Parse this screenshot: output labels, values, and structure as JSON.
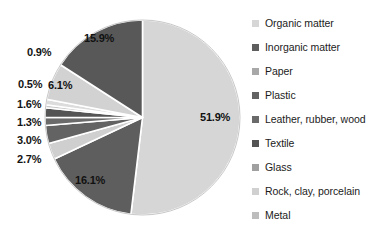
{
  "chart_data": {
    "type": "pie",
    "title": "",
    "subtitle": "",
    "xlabel": "",
    "ylabel": "",
    "legend_position": "right",
    "grid": false,
    "categories": [
      "Organic matter",
      "Inorganic matter",
      "Paper",
      "Plastic",
      "Leather, rubber, wood",
      "Textile",
      "Glass",
      "Rock, clay, porcelain",
      "Metal",
      "Particles < 10 mm"
    ],
    "values": [
      51.9,
      16.1,
      2.7,
      3.0,
      1.3,
      1.6,
      0.5,
      0.9,
      6.1,
      15.9
    ],
    "value_labels": [
      "51.9%",
      "16.1%",
      "2.7%",
      "3.0%",
      "1.3%",
      "1.6%",
      "0.5%",
      "0.9%",
      "6.1%",
      "15.9%"
    ],
    "colors": [
      "#d6d6d6",
      "#5e5e5e",
      "#cfcfcf",
      "#636363",
      "#6a6a6a",
      "#545454",
      "#c9c9c9",
      "#dcdcdc",
      "#d2d2d2",
      "#585858"
    ],
    "units": "percent",
    "total": 100.0,
    "start_angle_deg": 0,
    "direction": "clockwise"
  },
  "pie": {
    "labels": [
      {
        "text": "51.9%",
        "placement": "inside"
      },
      {
        "text": "16.1%",
        "placement": "inside"
      },
      {
        "text": "2.7%",
        "placement": "outside"
      },
      {
        "text": "3.0%",
        "placement": "outside"
      },
      {
        "text": "1.3%",
        "placement": "outside"
      },
      {
        "text": "1.6%",
        "placement": "outside"
      },
      {
        "text": "0.5%",
        "placement": "outside"
      },
      {
        "text": "0.9%",
        "placement": "outside"
      },
      {
        "text": "6.1%",
        "placement": "inside"
      },
      {
        "text": "15.9%",
        "placement": "inside"
      }
    ]
  },
  "legend": {
    "items": [
      {
        "label": "Organic matter",
        "color": "#d6d6d6"
      },
      {
        "label": "Inorganic matter",
        "color": "#5e5e5e"
      },
      {
        "label": "Paper",
        "color": "#a8a8a8"
      },
      {
        "label": "Plastic",
        "color": "#636363"
      },
      {
        "label": "Leather, rubber, wood",
        "color": "#6a6a6a"
      },
      {
        "label": "Textile",
        "color": "#545454"
      },
      {
        "label": "Glass",
        "color": "#a0a0a0"
      },
      {
        "label": "Rock, clay, porcelain",
        "color": "#d0d0d0"
      },
      {
        "label": "Metal",
        "color": "#bdbdbd"
      },
      {
        "label": "Particles < 10 mm",
        "color": "#585858"
      }
    ]
  },
  "colors": {
    "background": "#ffffff",
    "slice_border": "#ffffff",
    "text": "#1a1a1a"
  }
}
